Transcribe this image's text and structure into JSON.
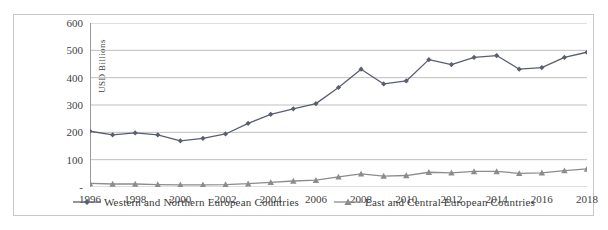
{
  "chart_data": {
    "type": "line",
    "title": "",
    "xlabel": "",
    "ylabel": "USD Billions",
    "x": [
      1996,
      1997,
      1998,
      1999,
      2000,
      2001,
      2002,
      2003,
      2004,
      2005,
      2006,
      2007,
      2008,
      2009,
      2010,
      2011,
      2012,
      2013,
      2014,
      2015,
      2016,
      2017,
      2018
    ],
    "xtick_labels": [
      "1996",
      "1998",
      "2000",
      "2002",
      "2004",
      "2006",
      "2008",
      "2010",
      "2012",
      "2014",
      "2016",
      "2018"
    ],
    "xtick_values": [
      1996,
      1998,
      2000,
      2002,
      2004,
      2006,
      2008,
      2010,
      2012,
      2014,
      2016,
      2018
    ],
    "xlim": [
      1996,
      2018
    ],
    "ytick_labels": [
      "600",
      "500",
      "400",
      "300",
      "200",
      "100",
      "-"
    ],
    "ytick_values": [
      600,
      500,
      400,
      300,
      200,
      100,
      0
    ],
    "ylim": [
      0,
      600
    ],
    "grid": "horizontal",
    "legend_position": "bottom",
    "series": [
      {
        "name": "Western and Northern European Countries",
        "marker": "diamond",
        "color": "#595f6e",
        "values": [
          204,
          191,
          198,
          191,
          169,
          178,
          194,
          233,
          266,
          286,
          305,
          364,
          431,
          377,
          388,
          466,
          448,
          474,
          481,
          431,
          437,
          474,
          493
        ]
      },
      {
        "name": "East and Central European Countries",
        "marker": "triangle",
        "color": "#8c8c8c",
        "values": [
          13,
          11,
          11,
          9,
          8,
          8,
          9,
          12,
          17,
          22,
          25,
          37,
          48,
          40,
          42,
          54,
          52,
          57,
          57,
          50,
          52,
          60,
          66
        ]
      }
    ]
  },
  "legend": {
    "items": [
      {
        "label": "Western and Northern European Countries",
        "marker": "diamond",
        "color": "#595f6e"
      },
      {
        "label": "East and Central European Countries",
        "marker": "triangle",
        "color": "#8c8c8c"
      }
    ]
  },
  "colors": {
    "frame_border": "#c8c8c8",
    "gridline": "#bfbfbf",
    "axis": "#9a9a9a",
    "background": "#ffffff",
    "text": "#3a3a3a"
  }
}
